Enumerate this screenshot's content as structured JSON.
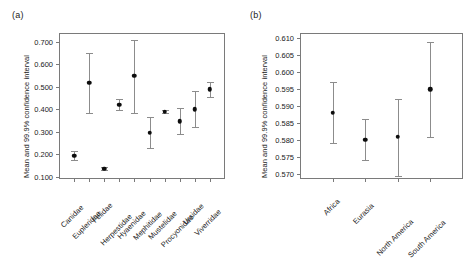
{
  "figure": {
    "background": "#ffffff",
    "marker_color": "#0d0d0d",
    "errorbar_color": "#8c8c8c",
    "frame_color": "#7a7a7a"
  },
  "panels": [
    {
      "key": "a",
      "label": "(a)",
      "ylabel": "Mean and 99.9% confidence interval"
    },
    {
      "key": "b",
      "label": "(b)",
      "ylabel": "Mean and 99.9% confidence interval"
    }
  ],
  "chart_data": [
    {
      "type": "scatter",
      "panel": "(a)",
      "title": "",
      "xlabel": "",
      "ylabel": "Mean and 99.9% confidence interval",
      "ylim": [
        0.09,
        0.74
      ],
      "yticks": [
        0.1,
        0.2,
        0.3,
        0.4,
        0.5,
        0.6,
        0.7
      ],
      "ytick_labels": [
        "0.100",
        "0.200",
        "0.300",
        "0.400",
        "0.500",
        "0.600",
        "0.700"
      ],
      "grid": false,
      "legend": "none",
      "categories": [
        "Canidae",
        "Eupleridae",
        "Felidae",
        "Herpestidae",
        "Hyaenidae",
        "Mephitidae",
        "Mustelidae",
        "Procyonidae",
        "Ursidae",
        "Viverridae"
      ],
      "values": [
        0.194,
        0.518,
        0.136,
        0.421,
        0.549,
        0.295,
        0.39,
        0.348,
        0.401,
        0.49
      ],
      "ci_lower": [
        0.176,
        0.385,
        0.13,
        0.398,
        0.386,
        0.226,
        0.382,
        0.291,
        0.321,
        0.455
      ],
      "ci_upper": [
        0.214,
        0.652,
        0.142,
        0.444,
        0.71,
        0.364,
        0.399,
        0.404,
        0.48,
        0.522
      ]
    },
    {
      "type": "scatter",
      "panel": "(b)",
      "title": "",
      "xlabel": "",
      "ylabel": "Mean and 99.9% confidence interval",
      "ylim": [
        0.5685,
        0.6115
      ],
      "yticks": [
        0.57,
        0.575,
        0.58,
        0.585,
        0.59,
        0.595,
        0.6,
        0.605,
        0.61
      ],
      "ytick_labels": [
        "0.570",
        "0.575",
        "0.580",
        "0.585",
        "0.590",
        "0.595",
        "0.600",
        "0.605",
        "0.610"
      ],
      "grid": false,
      "legend": "none",
      "categories": [
        "Africa",
        "Eurasia",
        "North America",
        "South America"
      ],
      "values": [
        0.588,
        0.58,
        0.581,
        0.595
      ],
      "ci_lower": [
        0.579,
        0.574,
        0.5695,
        0.581
      ],
      "ci_upper": [
        0.597,
        0.5862,
        0.5922,
        0.6088
      ]
    }
  ]
}
